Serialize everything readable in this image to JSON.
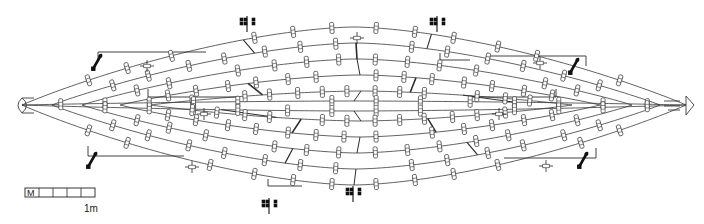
{
  "figure": {
    "name": "hull-plan-drawing",
    "type": "archaeological ship hull plan",
    "background_color": "#ffffff",
    "line_color": "#3a3a3a",
    "bold_mark_color": "#111111",
    "width": 704,
    "height": 224
  },
  "scale_bar": {
    "name": "scale-bar",
    "caption": "1m",
    "start_marker": "M",
    "segments": 5,
    "x": 25,
    "y": 188,
    "length": 70,
    "height": 9
  },
  "chart_data": {
    "type": "line",
    "title": "",
    "xlabel": "",
    "ylabel": "",
    "grid": false,
    "legend": null,
    "xlim": [
      0,
      704
    ],
    "ylim": [
      0,
      224
    ],
    "centerline_y": 105,
    "bow_x": 22,
    "stern_x": 686,
    "series": [
      {
        "name": "strake-outer-top",
        "amplitude": -78,
        "x0": 22,
        "x1": 686,
        "power": 0.62
      },
      {
        "name": "strake-2-top",
        "amplitude": -62,
        "x0": 52,
        "x1": 660,
        "power": 0.62
      },
      {
        "name": "strake-3-top",
        "amplitude": -46,
        "x0": 82,
        "x1": 632,
        "power": 0.62
      },
      {
        "name": "strake-4-top",
        "amplitude": -30,
        "x0": 120,
        "x1": 600,
        "power": 0.62
      },
      {
        "name": "strake-5-top",
        "amplitude": -14,
        "x0": 150,
        "x1": 572,
        "power": 0.62
      },
      {
        "name": "keel-line-upper",
        "amplitude": -4,
        "x0": 22,
        "x1": 686,
        "power": 0.62
      },
      {
        "name": "keel-line-lower",
        "amplitude": 6,
        "x0": 22,
        "x1": 686,
        "power": 0.62
      },
      {
        "name": "strake-5-bottom",
        "amplitude": 16,
        "x0": 150,
        "x1": 572,
        "power": 0.62
      },
      {
        "name": "strake-4-bottom",
        "amplitude": 32,
        "x0": 120,
        "x1": 600,
        "power": 0.62
      },
      {
        "name": "strake-3-bottom",
        "amplitude": 48,
        "x0": 82,
        "x1": 632,
        "power": 0.62
      },
      {
        "name": "strake-2-bottom",
        "amplitude": 64,
        "x0": 52,
        "x1": 660,
        "power": 0.62
      },
      {
        "name": "strake-outer-bottom",
        "amplitude": 80,
        "x0": 22,
        "x1": 686,
        "power": 0.62
      }
    ],
    "fastening_markers": {
      "name": "treenail-markers",
      "glyph": "rounded rectangle staple",
      "count_per_strake": 14,
      "width": 4,
      "height": 11
    },
    "bold_clusters": [
      {
        "name": "bold-cluster-upper-left",
        "x": 247,
        "y": 21
      },
      {
        "name": "bold-cluster-upper-right",
        "x": 437,
        "y": 21
      },
      {
        "name": "bold-cluster-lower-left",
        "x": 269,
        "y": 203
      },
      {
        "name": "bold-cluster-lower-right",
        "x": 353,
        "y": 191
      }
    ],
    "diagonal_marks": [
      {
        "name": "diagonal-mark-upper-left",
        "x": 97,
        "y": 62
      },
      {
        "name": "diagonal-mark-upper-right",
        "x": 574,
        "y": 66
      },
      {
        "name": "diagonal-mark-lower-left",
        "x": 92,
        "y": 160
      },
      {
        "name": "diagonal-mark-lower-right",
        "x": 583,
        "y": 160
      }
    ],
    "cross_markers": [
      {
        "name": "cross-marker-top-centre",
        "x": 357,
        "y": 38
      },
      {
        "name": "cross-marker-mid-left",
        "x": 204,
        "y": 114
      },
      {
        "name": "cross-marker-mid-right",
        "x": 499,
        "y": 114
      },
      {
        "name": "cross-marker-upper-left",
        "x": 147,
        "y": 66
      },
      {
        "name": "cross-marker-upper-right",
        "x": 540,
        "y": 63
      },
      {
        "name": "cross-marker-lower-left",
        "x": 192,
        "y": 167
      },
      {
        "name": "cross-marker-lower-right",
        "x": 546,
        "y": 166
      }
    ]
  }
}
